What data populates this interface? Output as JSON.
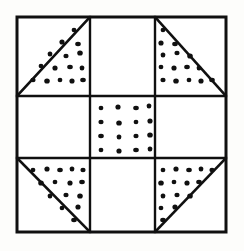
{
  "figure": {
    "background_color": "#fdfdfb",
    "line_color": "#101010",
    "dot_color": "#101010",
    "fill_color": "#ffffff"
  },
  "geometry": {
    "frame": {
      "x": 17,
      "y": 17,
      "width": 209,
      "height": 215
    },
    "outer_line_width": 3.0,
    "inner_line_width": 2.4,
    "diagonal_line_width": 2.6,
    "columns": [
      17,
      90,
      155,
      226
    ],
    "rows": [
      17,
      96,
      158,
      232
    ],
    "grid_columns": 3,
    "grid_rows": 3,
    "dot_radius": 2.6
  },
  "cells": [
    {
      "id": "cell-top-left",
      "name": "top-left-corner-triangle",
      "row": 0,
      "col": 0,
      "type": "triangle",
      "diagonal": "bottom-left-to-top-right",
      "dotted_half": "lower-right",
      "dot_count": 15
    },
    {
      "id": "cell-top-center",
      "name": "top-center-plain",
      "row": 0,
      "col": 1,
      "type": "plain",
      "dot_count": 0
    },
    {
      "id": "cell-top-right",
      "name": "top-right-corner-triangle",
      "row": 0,
      "col": 2,
      "type": "triangle",
      "diagonal": "top-left-to-bottom-right",
      "dotted_half": "lower-left",
      "dot_count": 15
    },
    {
      "id": "cell-middle-left",
      "name": "middle-left-plain",
      "row": 1,
      "col": 0,
      "type": "plain",
      "dot_count": 0
    },
    {
      "id": "cell-center",
      "name": "center-dotted-square",
      "row": 1,
      "col": 1,
      "type": "dotted-square",
      "dot_grid_columns": 4,
      "dot_grid_rows": 4,
      "dot_count": 16
    },
    {
      "id": "cell-middle-right",
      "name": "middle-right-plain",
      "row": 1,
      "col": 2,
      "type": "plain",
      "dot_count": 0
    },
    {
      "id": "cell-bottom-left",
      "name": "bottom-left-corner-triangle",
      "row": 2,
      "col": 0,
      "type": "triangle",
      "diagonal": "top-left-to-bottom-right",
      "dotted_half": "upper-right",
      "dot_count": 15
    },
    {
      "id": "cell-bottom-center",
      "name": "bottom-center-plain",
      "row": 2,
      "col": 1,
      "type": "plain",
      "dot_count": 0
    },
    {
      "id": "cell-bottom-right",
      "name": "bottom-right-corner-triangle",
      "row": 2,
      "col": 2,
      "type": "triangle",
      "diagonal": "bottom-left-to-top-right",
      "dotted_half": "upper-left",
      "dot_count": 15
    }
  ],
  "dot_positions": {
    "top_left_triangle": [
      [
        74,
        30
      ],
      [
        62,
        42
      ],
      [
        78,
        44
      ],
      [
        50,
        54
      ],
      [
        66,
        56
      ],
      [
        80,
        53
      ],
      [
        41,
        66
      ],
      [
        55,
        68
      ],
      [
        70,
        67
      ],
      [
        82,
        68
      ],
      [
        33,
        80
      ],
      [
        47,
        81
      ],
      [
        60,
        80
      ],
      [
        72,
        81
      ],
      [
        83,
        80
      ]
    ],
    "top_right_triangle": [
      [
        163,
        30
      ],
      [
        161,
        43
      ],
      [
        175,
        44
      ],
      [
        163,
        55
      ],
      [
        177,
        53
      ],
      [
        190,
        56
      ],
      [
        161,
        67
      ],
      [
        174,
        68
      ],
      [
        187,
        67
      ],
      [
        199,
        68
      ],
      [
        163,
        80
      ],
      [
        176,
        81
      ],
      [
        189,
        80
      ],
      [
        201,
        81
      ],
      [
        212,
        80
      ]
    ],
    "center_square": [
      [
        101,
        108
      ],
      [
        118,
        107
      ],
      [
        136,
        108
      ],
      [
        149,
        106
      ],
      [
        101,
        122
      ],
      [
        119,
        123
      ],
      [
        136,
        122
      ],
      [
        150,
        121
      ],
      [
        101,
        136
      ],
      [
        119,
        137
      ],
      [
        136,
        136
      ],
      [
        150,
        135
      ],
      [
        101,
        150
      ],
      [
        119,
        151
      ],
      [
        136,
        150
      ],
      [
        150,
        149
      ]
    ],
    "bottom_left_triangle": [
      [
        33,
        170
      ],
      [
        47,
        169
      ],
      [
        60,
        170
      ],
      [
        72,
        169
      ],
      [
        83,
        170
      ],
      [
        41,
        183
      ],
      [
        55,
        182
      ],
      [
        70,
        183
      ],
      [
        82,
        182
      ],
      [
        50,
        196
      ],
      [
        66,
        195
      ],
      [
        80,
        196
      ],
      [
        62,
        208
      ],
      [
        78,
        207
      ],
      [
        74,
        220
      ]
    ],
    "bottom_right_triangle": [
      [
        163,
        170
      ],
      [
        176,
        169
      ],
      [
        189,
        170
      ],
      [
        201,
        169
      ],
      [
        212,
        170
      ],
      [
        161,
        183
      ],
      [
        174,
        182
      ],
      [
        187,
        183
      ],
      [
        199,
        182
      ],
      [
        163,
        196
      ],
      [
        177,
        195
      ],
      [
        190,
        196
      ],
      [
        161,
        208
      ],
      [
        175,
        207
      ],
      [
        163,
        220
      ]
    ]
  }
}
